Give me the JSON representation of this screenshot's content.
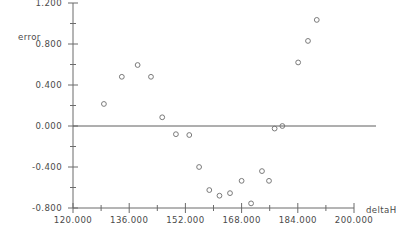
{
  "chart_data": {
    "type": "scatter",
    "title": "",
    "subtitle": "",
    "xlabel": "deltaH",
    "ylabel": "error",
    "xlim": [
      120.0,
      200.0
    ],
    "ylim": [
      -0.8,
      1.2
    ],
    "grid": false,
    "legend": null,
    "xticks": [
      120.0,
      136.0,
      152.0,
      168.0,
      184.0,
      200.0
    ],
    "xtick_labels": [
      "120.000",
      "136.000",
      "152.000",
      "168.000",
      "184.000",
      "200.000"
    ],
    "xminor_ticks": [
      128.0,
      144.0,
      160.0,
      176.0,
      192.0
    ],
    "yticks": [
      1.2,
      0.8,
      0.4,
      0.0,
      -0.4,
      -0.8
    ],
    "ytick_labels": [
      "1.200",
      "0.800",
      "0.400",
      "0.000",
      "-0.400",
      "-0.800"
    ],
    "yminor_ticks": [
      1.0,
      0.6,
      0.2,
      -0.2,
      -0.6
    ],
    "reference_lines": [
      {
        "axis": "y",
        "value": 0.0
      }
    ],
    "marker": "open-circle",
    "points": [
      {
        "x": 128.8,
        "y": 0.215
      },
      {
        "x": 133.9,
        "y": 0.48
      },
      {
        "x": 138.4,
        "y": 0.595
      },
      {
        "x": 142.2,
        "y": 0.48
      },
      {
        "x": 145.4,
        "y": 0.085
      },
      {
        "x": 149.3,
        "y": -0.08
      },
      {
        "x": 153.1,
        "y": -0.088
      },
      {
        "x": 155.9,
        "y": -0.4
      },
      {
        "x": 158.8,
        "y": -0.625
      },
      {
        "x": 161.7,
        "y": -0.68
      },
      {
        "x": 164.7,
        "y": -0.655
      },
      {
        "x": 168.0,
        "y": -0.535
      },
      {
        "x": 170.7,
        "y": -0.755
      },
      {
        "x": 173.8,
        "y": -0.44
      },
      {
        "x": 175.8,
        "y": -0.535
      },
      {
        "x": 177.4,
        "y": -0.025
      },
      {
        "x": 179.6,
        "y": 0.0
      },
      {
        "x": 184.1,
        "y": 0.62
      },
      {
        "x": 186.9,
        "y": 0.83
      },
      {
        "x": 189.4,
        "y": 1.035
      }
    ]
  }
}
